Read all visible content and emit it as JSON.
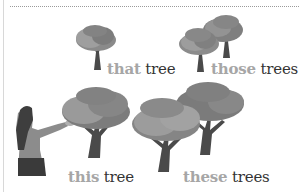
{
  "illustration": {
    "labels": [
      {
        "id": "that",
        "determiner": "that",
        "noun": "tree"
      },
      {
        "id": "those",
        "determiner": "those",
        "noun": "trees"
      },
      {
        "id": "this",
        "determiner": "this",
        "noun": "tree"
      },
      {
        "id": "these",
        "determiner": "these",
        "noun": "trees"
      }
    ],
    "colors": {
      "determiner": "#a6a6a6",
      "noun": "#333333",
      "foliage_dark": "#7a7a7a",
      "foliage_light": "#9a9a9a",
      "trunk": "#4a4a4a"
    }
  }
}
